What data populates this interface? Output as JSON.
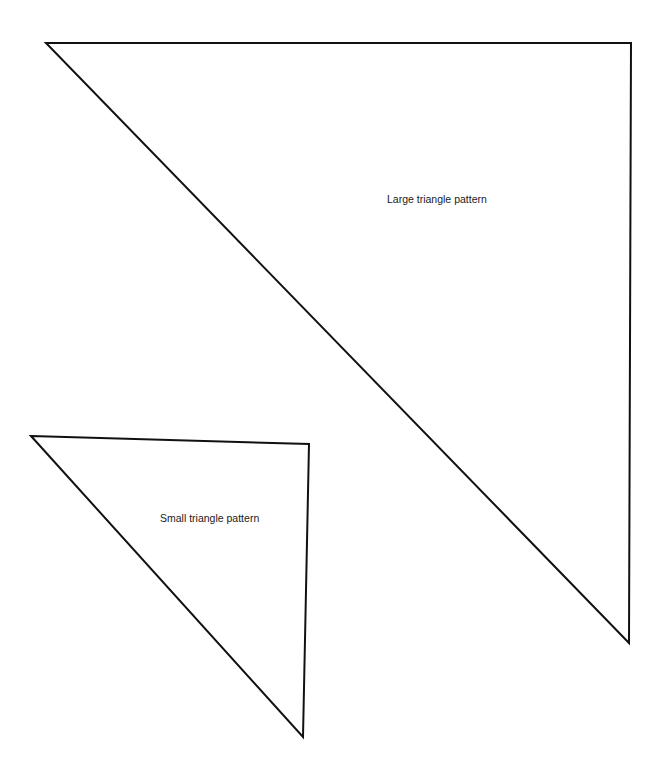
{
  "diagram": {
    "shapes": [
      {
        "id": "large-triangle",
        "label": "Large triangle pattern",
        "points": [
          [
            46,
            43
          ],
          [
            631,
            43
          ],
          [
            629,
            643
          ]
        ],
        "label_pos": [
          387,
          193
        ]
      },
      {
        "id": "small-triangle",
        "label": "Small triangle pattern",
        "points": [
          [
            31,
            436
          ],
          [
            309,
            444
          ],
          [
            303,
            737
          ]
        ],
        "label_pos": [
          160,
          512
        ]
      }
    ],
    "stroke_color": "#111111",
    "background_color": "#ffffff"
  }
}
